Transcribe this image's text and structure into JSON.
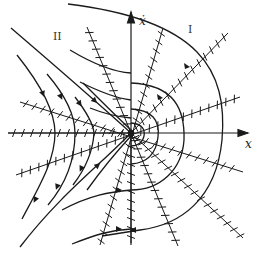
{
  "diagram": {
    "type": "phase-portrait",
    "center": [
      131,
      133
    ],
    "axes": {
      "x_label": "x",
      "y_label": "ẋ"
    },
    "regions": {
      "region_1": "I",
      "region_2": "II"
    },
    "colors": {
      "ink": "#1a1a1a",
      "background": "#ffffff"
    }
  }
}
